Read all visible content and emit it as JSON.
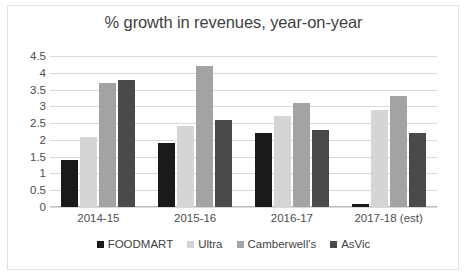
{
  "chart_data": {
    "type": "bar",
    "title": "% growth in revenues, year-on-year",
    "xlabel": "",
    "ylabel": "",
    "ylim": [
      0,
      4.5
    ],
    "yticks": [
      "0",
      "0.5",
      "1",
      "1.5",
      "2",
      "2.5",
      "3",
      "3.5",
      "4",
      "4.5"
    ],
    "ytick_values": [
      0,
      0.5,
      1,
      1.5,
      2,
      2.5,
      3,
      3.5,
      4,
      4.5
    ],
    "grid": true,
    "legend_position": "bottom",
    "categories": [
      "2014-15",
      "2015-16",
      "2016-17",
      "2017-18 (est)"
    ],
    "series": [
      {
        "name": "FOODMART",
        "color": "#1a1a1a",
        "values": [
          1.4,
          1.9,
          2.2,
          0.1
        ]
      },
      {
        "name": "Ultra",
        "color": "#d5d5d5",
        "values": [
          2.1,
          2.4,
          2.7,
          2.9
        ]
      },
      {
        "name": "Camberwell's",
        "color": "#a3a3a3",
        "values": [
          3.7,
          4.2,
          3.1,
          3.3
        ]
      },
      {
        "name": "AsVic",
        "color": "#4a4a4a",
        "values": [
          3.8,
          2.6,
          2.3,
          2.2
        ]
      }
    ]
  },
  "colors": {
    "grid": "#d9d9d9",
    "axis": "#bfbfbf",
    "text": "#4d4d4d",
    "title": "#3f3f3f",
    "border": "#e2e2e2",
    "background": "#ffffff"
  }
}
